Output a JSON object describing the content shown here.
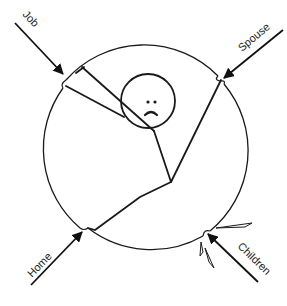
{
  "diagram": {
    "title": "",
    "colors": {
      "stroke": "#1a1a1a",
      "background": "#ffffff",
      "arrow": "#111111"
    },
    "forces": [
      {
        "id": "job",
        "label": "Job"
      },
      {
        "id": "spouse",
        "label": "Spouse"
      },
      {
        "id": "home",
        "label": "Home"
      },
      {
        "id": "children",
        "label": "Children"
      }
    ],
    "figure": {
      "expression": "sad-face",
      "description": "stick figure stretched inside a circle, pulled by four arrows"
    }
  }
}
